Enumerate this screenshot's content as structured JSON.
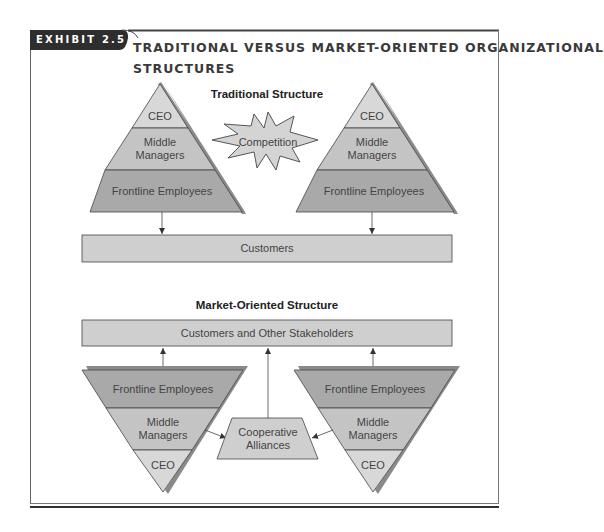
{
  "header": {
    "exhibit_label": "EXHIBIT 2.5",
    "title_line1": "TRADITIONAL VERSUS MARKET-ORIENTED ORGANIZATIONAL",
    "title_line2": "STRUCTURES"
  },
  "traditional": {
    "heading": "Traditional Structure",
    "pyramid_left": {
      "tiers": [
        {
          "lines": [
            "CEO"
          ]
        },
        {
          "lines": [
            "Middle",
            "Managers"
          ]
        },
        {
          "lines": [
            "Frontline Employees"
          ]
        }
      ]
    },
    "pyramid_right": {
      "tiers": [
        {
          "lines": [
            "CEO"
          ]
        },
        {
          "lines": [
            "Middle",
            "Managers"
          ]
        },
        {
          "lines": [
            "Frontline Employees"
          ]
        }
      ]
    },
    "competition_label": "Competition",
    "customers_label": "Customers"
  },
  "market_oriented": {
    "heading": "Market-Oriented Structure",
    "stakeholders_label": "Customers and Other Stakeholders",
    "pyramid_left": {
      "tiers": [
        {
          "lines": [
            "Frontline Employees"
          ]
        },
        {
          "lines": [
            "Middle",
            "Managers"
          ]
        },
        {
          "lines": [
            "CEO"
          ]
        }
      ]
    },
    "pyramid_right": {
      "tiers": [
        {
          "lines": [
            "Frontline Employees"
          ]
        },
        {
          "lines": [
            "Middle",
            "Managers"
          ]
        },
        {
          "lines": [
            "CEO"
          ]
        }
      ]
    },
    "alliances_lines": [
      "Cooperative",
      "Alliances"
    ]
  },
  "colors": {
    "header_bg": "#2e2e2e",
    "frame_line": "#555555",
    "tier_light": "#d8d8d8",
    "tier_mid": "#c4c4c4",
    "tier_dark": "#a9a9a9",
    "box_fill": "#cfcfcf",
    "shadow": "#8a8a8a",
    "text": "#444444"
  }
}
